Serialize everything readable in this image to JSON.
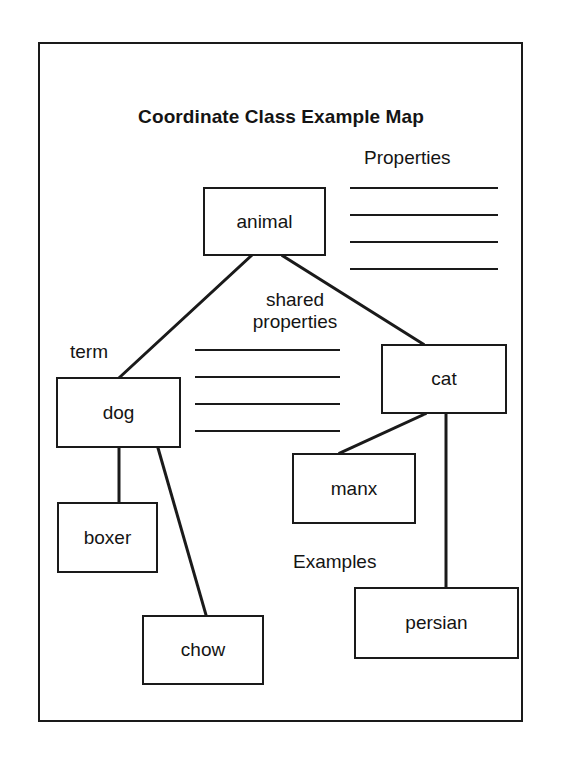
{
  "diagram": {
    "title": "Coordinate Class Example Map",
    "labels": {
      "properties": "Properties",
      "shared_line1": "shared",
      "shared_line2": "properties",
      "term": "term",
      "examples": "Examples"
    },
    "nodes": {
      "animal": "animal",
      "dog": "dog",
      "cat": "cat",
      "boxer": "boxer",
      "chow": "chow",
      "manx": "manx",
      "persian": "persian"
    },
    "edges": [
      {
        "from": "animal",
        "to": "dog"
      },
      {
        "from": "animal",
        "to": "cat"
      },
      {
        "from": "dog",
        "to": "boxer"
      },
      {
        "from": "dog",
        "to": "chow"
      },
      {
        "from": "cat",
        "to": "manx"
      },
      {
        "from": "cat",
        "to": "persian"
      }
    ],
    "properties_blank_lines": 4,
    "shared_properties_blank_lines": 4,
    "colors": {
      "ink": "#1a1a1a",
      "background": "#ffffff"
    }
  }
}
